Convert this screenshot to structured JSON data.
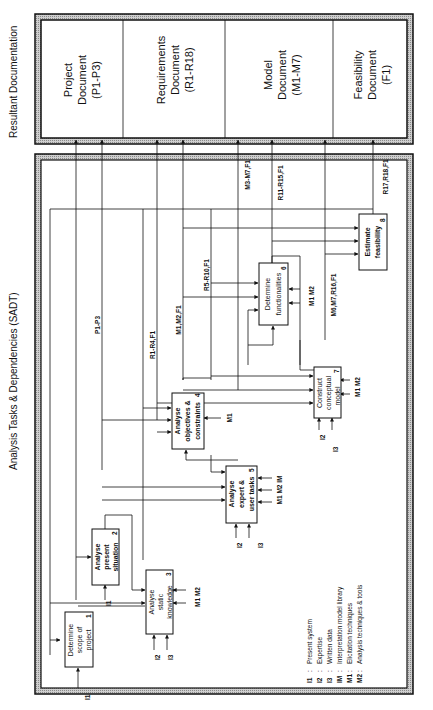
{
  "titles": {
    "documentation": "Resultant Documentation",
    "diagram": "Analysis Tasks & Dependencies (SADT)"
  },
  "documents": [
    {
      "line1": "Project",
      "line2": "Document",
      "line3": "(P1-P3)"
    },
    {
      "line1": "Requirements",
      "line2": "Document",
      "line3": "(R1-R18)"
    },
    {
      "line1": "Model",
      "line2": "Document",
      "line3": "(M1-M7)"
    },
    {
      "line1": "Feasibility",
      "line2": "Document",
      "line3": "(F1)"
    }
  ],
  "activities": [
    {
      "id": "1",
      "lines": [
        "Determine",
        "scope of",
        "project"
      ]
    },
    {
      "id": "2",
      "lines": [
        "Analyse",
        "present",
        "situation"
      ]
    },
    {
      "id": "3",
      "lines": [
        "Analyse",
        "static",
        "knowledge"
      ]
    },
    {
      "id": "4",
      "lines": [
        "Analyse",
        "objectives &",
        "constraints"
      ]
    },
    {
      "id": "5",
      "lines": [
        "Analyse",
        "expert &",
        "user tasks"
      ]
    },
    {
      "id": "6",
      "lines": [
        "Determine",
        "functionalities"
      ]
    },
    {
      "id": "7",
      "lines": [
        "Construct",
        "conceptual",
        "model"
      ]
    },
    {
      "id": "8",
      "lines": [
        "Estimate",
        "feasibility"
      ]
    }
  ],
  "flow_labels": {
    "p1_p3": "P1-P3",
    "r1_r4": "R1-R4,F1",
    "m1_m2_f1": "M1,M2,F1",
    "r5_r10": "R5-R10,F1",
    "m3_m7": "M3-M7,F1",
    "r11_r15": "R11-R15,F1",
    "m6_m7_r16": "M6,M7,R16,F1",
    "r17_r18": "R17,R18,F1"
  },
  "mechanism_labels": {
    "box3": "M1 M2",
    "box4": "M1",
    "box5": "M1 M2 IM",
    "box6": "M1 M2",
    "box7": "M1 M2"
  },
  "input_labels": {
    "i1": "I1",
    "i2": "I2",
    "i3": "I3"
  },
  "legend": [
    {
      "code": "I1",
      "sep": ":",
      "text": "Present system"
    },
    {
      "code": "I2",
      "sep": ":",
      "text": "Expertise"
    },
    {
      "code": "I3",
      "sep": ":",
      "text": "Written data"
    },
    {
      "code": "IM",
      "sep": ":",
      "text": "Interpretation model library"
    },
    {
      "code": "M1",
      "sep": ":",
      "text": "Elicitation techniques"
    },
    {
      "code": "M2",
      "sep": ":",
      "text": "Analysis techniques & tools"
    }
  ],
  "colors": {
    "ink": "#111111",
    "frame_shade": "#b5b5b5",
    "paper": "#ffffff"
  }
}
